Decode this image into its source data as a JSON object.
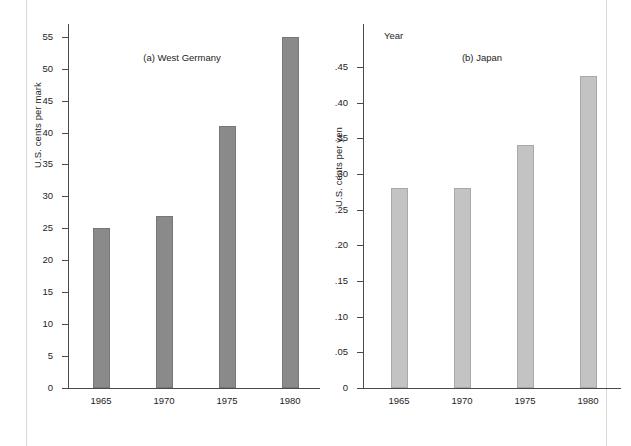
{
  "figure": {
    "panel_count": 2,
    "background_color": "#ffffff"
  },
  "chart_data": [
    {
      "type": "bar",
      "id": "west-germany",
      "title": "(a) West Germany",
      "xlabel": "Year",
      "ylabel": "U.S. cents per mark",
      "categories": [
        "1965",
        "1970",
        "1975",
        "1980"
      ],
      "values": [
        25,
        27,
        41,
        55
      ],
      "ylim": [
        0,
        57
      ],
      "yticks": [
        0,
        5,
        10,
        15,
        20,
        25,
        30,
        35,
        40,
        45,
        50,
        55
      ],
      "ytick_labels": [
        "0",
        "5",
        "10",
        "15",
        "20",
        "25",
        "30",
        "35",
        "40",
        "45",
        "50",
        "55"
      ],
      "grid": false,
      "legend": "none",
      "bar_color": "#8a8a8a"
    },
    {
      "type": "bar",
      "id": "japan",
      "title": "(b) Japan",
      "xlabel": "Year",
      "ylabel": "U.S. cents per yen",
      "categories": [
        "1965",
        "1970",
        "1975",
        "1980"
      ],
      "values": [
        0.28,
        0.28,
        0.34,
        0.437
      ],
      "ylim": [
        0,
        0.51
      ],
      "yticks": [
        0,
        0.05,
        0.1,
        0.15,
        0.2,
        0.25,
        0.3,
        0.35,
        0.4,
        0.45
      ],
      "ytick_labels": [
        "0",
        ".05",
        ".10",
        ".15",
        ".20",
        ".25",
        ".30",
        ".35",
        ".40",
        ".45"
      ],
      "grid": false,
      "legend": "none",
      "bar_color": "#c3c3c3"
    }
  ]
}
